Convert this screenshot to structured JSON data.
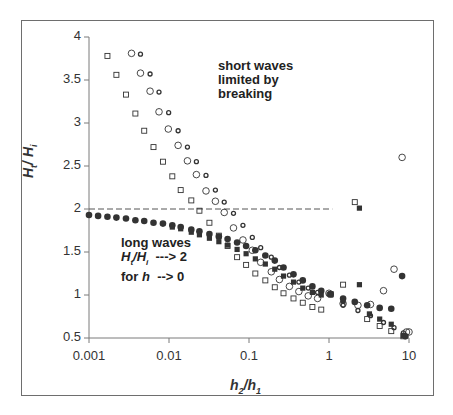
{
  "chart_data": {
    "type": "scatter",
    "title": "",
    "xlabel": "h2/h1",
    "ylabel": "Ht/Hi",
    "xscale": "log",
    "xlim": [
      0.001,
      10
    ],
    "ylim": [
      0.5,
      4
    ],
    "x_ticks": [
      "0.001",
      "0.01",
      "0.1",
      "1",
      "10"
    ],
    "y_ticks": [
      "0.5",
      "1",
      "1.5",
      "2",
      "2.5",
      "3",
      "3.5",
      "4"
    ],
    "grid": false,
    "legend": null,
    "reference_line": {
      "y": 2,
      "x_from": 0.001,
      "x_to": 1.1,
      "style": "dashed"
    },
    "annotations": [
      {
        "text_lines": [
          "short waves",
          "limited by",
          "breaking"
        ],
        "x": 0.012,
        "y": 3.6
      },
      {
        "text_lines": [
          "long waves",
          "Ht/Hi ---> 2",
          "for h ---> 0"
        ],
        "x": 0.0045,
        "y": 1.55
      }
    ],
    "series": [
      {
        "name": "open-squares",
        "marker": "square-open",
        "points": [
          [
            0.0017,
            3.78
          ],
          [
            0.0022,
            3.56
          ],
          [
            0.0029,
            3.33
          ],
          [
            0.0038,
            3.11
          ],
          [
            0.0049,
            2.91
          ],
          [
            0.0064,
            2.72
          ],
          [
            0.0084,
            2.55
          ],
          [
            0.011,
            2.38
          ],
          [
            0.014,
            2.22
          ],
          [
            0.019,
            2.1
          ],
          [
            0.024,
            1.98
          ],
          [
            0.032,
            1.84
          ],
          [
            0.042,
            1.69
          ],
          [
            0.054,
            1.57
          ],
          [
            0.071,
            1.44
          ],
          [
            0.092,
            1.35
          ],
          [
            0.12,
            1.25
          ],
          [
            0.16,
            1.17
          ],
          [
            0.21,
            1.09
          ],
          [
            0.27,
            1.02
          ],
          [
            0.36,
            0.96
          ],
          [
            0.47,
            0.91
          ],
          [
            0.62,
            0.86
          ],
          [
            0.8,
            0.83
          ],
          [
            1.05,
            1.01
          ],
          [
            1.5,
            1.12
          ],
          [
            2.1,
            2.08
          ],
          [
            3.0,
            0.72
          ],
          [
            4.3,
            0.64
          ],
          [
            6.0,
            0.58
          ],
          [
            8.5,
            0.52
          ]
        ]
      },
      {
        "name": "open-circles",
        "marker": "circle-open",
        "points": [
          [
            0.0034,
            3.81
          ],
          [
            0.0044,
            3.58
          ],
          [
            0.0058,
            3.37
          ],
          [
            0.0075,
            3.13
          ],
          [
            0.0098,
            2.93
          ],
          [
            0.013,
            2.74
          ],
          [
            0.017,
            2.56
          ],
          [
            0.022,
            2.4
          ],
          [
            0.029,
            2.21
          ],
          [
            0.038,
            2.09
          ],
          [
            0.049,
            1.96
          ],
          [
            0.064,
            1.78
          ],
          [
            0.084,
            1.64
          ],
          [
            0.11,
            1.52
          ],
          [
            0.14,
            1.38
          ],
          [
            0.19,
            1.27
          ],
          [
            0.24,
            1.18
          ],
          [
            0.32,
            1.1
          ],
          [
            0.42,
            1.04
          ],
          [
            0.55,
            0.99
          ],
          [
            0.72,
            0.96
          ],
          [
            1.0,
            1.02
          ],
          [
            1.5,
            0.9
          ],
          [
            2.3,
            0.88
          ],
          [
            3.3,
            0.89
          ],
          [
            4.8,
            1.05
          ],
          [
            6.5,
            1.3
          ],
          [
            8.2,
            2.6
          ],
          [
            9.3,
            0.57
          ],
          [
            10.0,
            0.57
          ]
        ]
      },
      {
        "name": "open-diamonds",
        "marker": "diamond-open",
        "points": [
          [
            0.0044,
            3.8
          ],
          [
            0.0058,
            3.57
          ],
          [
            0.0075,
            3.36
          ],
          [
            0.0099,
            3.12
          ],
          [
            0.013,
            2.91
          ],
          [
            0.017,
            2.72
          ],
          [
            0.022,
            2.55
          ],
          [
            0.029,
            2.39
          ],
          [
            0.038,
            2.22
          ],
          [
            0.049,
            2.08
          ],
          [
            0.064,
            1.95
          ],
          [
            0.084,
            1.81
          ],
          [
            0.11,
            1.67
          ],
          [
            0.14,
            1.55
          ],
          [
            0.19,
            1.44
          ],
          [
            0.24,
            1.32
          ],
          [
            0.32,
            1.23
          ],
          [
            0.42,
            1.15
          ],
          [
            0.55,
            1.08
          ],
          [
            0.72,
            1.03
          ],
          [
            1.0,
            1.01
          ],
          [
            1.5,
            0.88
          ],
          [
            2.3,
            0.82
          ],
          [
            3.3,
            0.76
          ],
          [
            4.8,
            0.68
          ],
          [
            6.5,
            0.62
          ],
          [
            8.5,
            0.56
          ]
        ]
      },
      {
        "name": "filled-circles",
        "marker": "circle-filled",
        "points": [
          [
            0.001,
            1.93
          ],
          [
            0.0013,
            1.92
          ],
          [
            0.0017,
            1.91
          ],
          [
            0.0022,
            1.9
          ],
          [
            0.0029,
            1.89
          ],
          [
            0.0038,
            1.87
          ],
          [
            0.0049,
            1.86
          ],
          [
            0.0064,
            1.84
          ],
          [
            0.0084,
            1.83
          ],
          [
            0.011,
            1.81
          ],
          [
            0.014,
            1.79
          ],
          [
            0.019,
            1.76
          ],
          [
            0.024,
            1.74
          ],
          [
            0.032,
            1.71
          ],
          [
            0.042,
            1.68
          ],
          [
            0.054,
            1.65
          ],
          [
            0.071,
            1.61
          ],
          [
            0.092,
            1.57
          ],
          [
            0.12,
            1.52
          ],
          [
            0.16,
            1.46
          ],
          [
            0.21,
            1.4
          ],
          [
            0.27,
            1.32
          ],
          [
            0.36,
            1.24
          ],
          [
            0.47,
            1.17
          ],
          [
            0.62,
            1.1
          ],
          [
            0.8,
            1.05
          ],
          [
            1.05,
            1.01
          ],
          [
            1.5,
            0.96
          ],
          [
            2.1,
            0.92
          ],
          [
            3.0,
            0.88
          ],
          [
            4.3,
            0.85
          ],
          [
            6.0,
            0.84
          ],
          [
            8.2,
            1.22
          ],
          [
            9.0,
            0.52
          ]
        ]
      },
      {
        "name": "filled-squares",
        "marker": "square-filled",
        "points": [
          [
            0.011,
            1.79
          ],
          [
            0.014,
            1.77
          ],
          [
            0.019,
            1.73
          ],
          [
            0.024,
            1.7
          ],
          [
            0.032,
            1.66
          ],
          [
            0.042,
            1.62
          ],
          [
            0.054,
            1.58
          ],
          [
            0.071,
            1.53
          ],
          [
            0.092,
            1.48
          ],
          [
            0.12,
            1.42
          ],
          [
            0.16,
            1.36
          ],
          [
            0.21,
            1.3
          ],
          [
            0.27,
            1.22
          ],
          [
            0.36,
            1.15
          ],
          [
            0.47,
            1.08
          ],
          [
            0.62,
            1.03
          ],
          [
            0.8,
            1.0
          ],
          [
            1.05,
            1.0
          ],
          [
            1.5,
            0.93
          ],
          [
            2.4,
            1.12
          ],
          [
            2.4,
            2.01
          ],
          [
            3.2,
            0.78
          ],
          [
            4.3,
            0.72
          ],
          [
            6.0,
            0.66
          ],
          [
            8.5,
            0.53
          ]
        ]
      }
    ]
  },
  "labels": {
    "annotation_short": [
      "short waves",
      "limited by",
      "breaking"
    ],
    "annotation_long_1": "long waves",
    "annotation_long_3": "for",
    "y_title_main": "H",
    "y_title_sub1": "t",
    "y_title_main2": "/ H",
    "y_title_sub2": "i",
    "x_title_main": "h",
    "x_title_sub1": "2",
    "x_title_main2": "/h",
    "x_title_sub2": "1"
  },
  "colors": {
    "axis": "#7a7a7a",
    "marker": "#333333",
    "frame": "#6e6e6e",
    "text": "#333333"
  }
}
